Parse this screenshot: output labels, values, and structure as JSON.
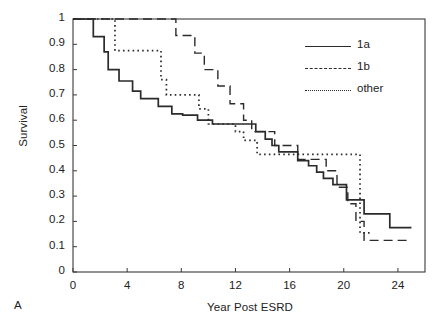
{
  "panel": {
    "letter": "A"
  },
  "chart_data": {
    "type": "line",
    "title": "",
    "subtitle": "",
    "xlabel": "Year Post ESRD",
    "ylabel": "Survival",
    "xlim": [
      0,
      26
    ],
    "ylim": [
      0,
      1
    ],
    "xticks": [
      0,
      4,
      8,
      12,
      16,
      20,
      24
    ],
    "xtick_labels": [
      "0",
      "4",
      "8",
      "12",
      "16",
      "20",
      "24"
    ],
    "yticks": [
      0,
      0.1,
      0.2,
      0.3,
      0.4,
      0.5,
      0.6,
      0.7,
      0.8,
      0.9,
      1
    ],
    "ytick_labels": [
      "0",
      "0.1",
      "0.2",
      "0.3",
      "0.4",
      "0.5",
      "0.6",
      "0.7",
      "0.8",
      "0.9",
      "1"
    ],
    "grid": false,
    "legend_position": "top-right",
    "legend_entries": [
      "1a",
      "1b",
      "other"
    ],
    "series": [
      {
        "name": "1a",
        "style": "solid",
        "color": "#2b2b2b",
        "points": [
          [
            0.0,
            1.0
          ],
          [
            1.5,
            1.0
          ],
          [
            1.5,
            0.93
          ],
          [
            2.3,
            0.93
          ],
          [
            2.3,
            0.87
          ],
          [
            2.6,
            0.87
          ],
          [
            2.6,
            0.8
          ],
          [
            3.4,
            0.8
          ],
          [
            3.4,
            0.755
          ],
          [
            4.4,
            0.755
          ],
          [
            4.4,
            0.715
          ],
          [
            5.0,
            0.715
          ],
          [
            5.0,
            0.685
          ],
          [
            6.3,
            0.685
          ],
          [
            6.3,
            0.655
          ],
          [
            7.3,
            0.655
          ],
          [
            7.3,
            0.625
          ],
          [
            8.1,
            0.625
          ],
          [
            8.1,
            0.62
          ],
          [
            9.2,
            0.62
          ],
          [
            9.2,
            0.6
          ],
          [
            10.3,
            0.6
          ],
          [
            10.3,
            0.585
          ],
          [
            13.5,
            0.585
          ],
          [
            13.5,
            0.555
          ],
          [
            14.2,
            0.555
          ],
          [
            14.2,
            0.525
          ],
          [
            14.7,
            0.525
          ],
          [
            14.7,
            0.5
          ],
          [
            15.2,
            0.5
          ],
          [
            15.2,
            0.475
          ],
          [
            16.6,
            0.475
          ],
          [
            16.6,
            0.44
          ],
          [
            17.4,
            0.44
          ],
          [
            17.4,
            0.42
          ],
          [
            18.0,
            0.42
          ],
          [
            18.0,
            0.395
          ],
          [
            18.5,
            0.395
          ],
          [
            18.5,
            0.37
          ],
          [
            19.2,
            0.37
          ],
          [
            19.2,
            0.345
          ],
          [
            20.2,
            0.345
          ],
          [
            20.2,
            0.285
          ],
          [
            21.5,
            0.285
          ],
          [
            21.5,
            0.23
          ],
          [
            23.4,
            0.23
          ],
          [
            23.4,
            0.175
          ],
          [
            25.0,
            0.175
          ]
        ]
      },
      {
        "name": "1b",
        "style": "dashed",
        "color": "#2b2b2b",
        "points": [
          [
            0.0,
            1.0
          ],
          [
            7.6,
            1.0
          ],
          [
            7.6,
            0.935
          ],
          [
            9.0,
            0.935
          ],
          [
            9.0,
            0.865
          ],
          [
            9.7,
            0.865
          ],
          [
            9.7,
            0.8
          ],
          [
            10.7,
            0.8
          ],
          [
            10.7,
            0.735
          ],
          [
            11.6,
            0.735
          ],
          [
            11.6,
            0.665
          ],
          [
            12.6,
            0.665
          ],
          [
            12.6,
            0.6
          ],
          [
            13.2,
            0.6
          ],
          [
            13.2,
            0.555
          ],
          [
            14.9,
            0.555
          ],
          [
            14.9,
            0.5
          ],
          [
            16.6,
            0.5
          ],
          [
            16.6,
            0.445
          ],
          [
            18.7,
            0.445
          ],
          [
            18.7,
            0.4
          ],
          [
            19.5,
            0.4
          ],
          [
            19.5,
            0.335
          ],
          [
            20.3,
            0.335
          ],
          [
            20.3,
            0.27
          ],
          [
            20.9,
            0.27
          ],
          [
            20.9,
            0.2
          ],
          [
            21.5,
            0.2
          ],
          [
            21.5,
            0.125
          ],
          [
            25.0,
            0.125
          ]
        ]
      },
      {
        "name": "other",
        "style": "dotted",
        "color": "#2b2b2b",
        "points": [
          [
            0.0,
            1.0
          ],
          [
            3.1,
            1.0
          ],
          [
            3.1,
            0.875
          ],
          [
            6.5,
            0.875
          ],
          [
            6.5,
            0.76
          ],
          [
            6.9,
            0.76
          ],
          [
            6.9,
            0.7
          ],
          [
            9.3,
            0.7
          ],
          [
            9.3,
            0.645
          ],
          [
            10.0,
            0.645
          ],
          [
            10.0,
            0.585
          ],
          [
            12.0,
            0.585
          ],
          [
            12.0,
            0.555
          ],
          [
            12.6,
            0.555
          ],
          [
            12.6,
            0.52
          ],
          [
            13.6,
            0.52
          ],
          [
            13.6,
            0.465
          ],
          [
            21.2,
            0.465
          ],
          [
            21.2,
            0.155
          ],
          [
            22.0,
            0.155
          ]
        ]
      }
    ]
  }
}
